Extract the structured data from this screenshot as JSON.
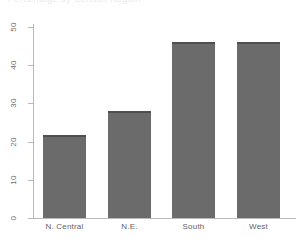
{
  "figure": {
    "ghost_title": "Percentage by Census Region",
    "background_color": "#ffffff"
  },
  "style": {
    "bar_fill": "#6b6b6b",
    "bar_edge": "#4f4f4f",
    "axis_color": "#b9b9bd",
    "tick_label_color": "#6d6d72"
  },
  "chart_data": {
    "type": "bar",
    "title": "",
    "xlabel": "",
    "ylabel": "",
    "categories": [
      "N. Central",
      "N.E.",
      "South",
      "West"
    ],
    "values": [
      21.7,
      28.0,
      46.0,
      46.0
    ],
    "ylim": [
      0,
      50
    ],
    "yticks": [
      0,
      10,
      20,
      30,
      40,
      50
    ],
    "ytick_labels": [
      "0",
      "10",
      "20",
      "30",
      "40",
      "50"
    ],
    "grid": false,
    "legend": null,
    "orientation": "vertical"
  }
}
